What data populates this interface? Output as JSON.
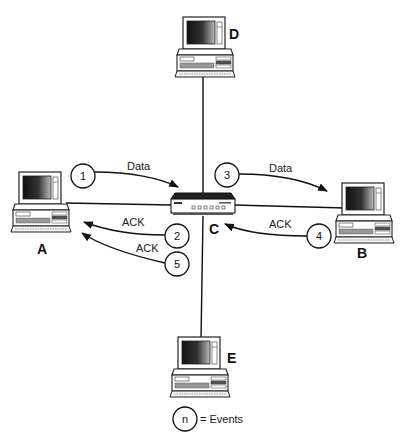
{
  "diagram": {
    "type": "star-network",
    "hub": {
      "id": "C",
      "label": "C",
      "kind": "hub"
    },
    "nodes": [
      {
        "id": "A",
        "label": "A",
        "kind": "computer",
        "position": "left"
      },
      {
        "id": "B",
        "label": "B",
        "kind": "computer",
        "position": "right"
      },
      {
        "id": "D",
        "label": "D",
        "kind": "computer",
        "position": "top"
      },
      {
        "id": "E",
        "label": "E",
        "kind": "computer",
        "position": "bottom"
      }
    ],
    "events": [
      {
        "n": "1",
        "label": "Data",
        "from": "A",
        "to": "C"
      },
      {
        "n": "2",
        "label": "ACK",
        "from": "C",
        "to": "A"
      },
      {
        "n": "3",
        "label": "Data",
        "from": "C",
        "to": "B"
      },
      {
        "n": "4",
        "label": "ACK",
        "from": "B",
        "to": "C"
      },
      {
        "n": "5",
        "label": "ACK",
        "from": "C",
        "to": "A"
      }
    ],
    "legend": {
      "symbol": "n",
      "text": "= Events"
    }
  }
}
